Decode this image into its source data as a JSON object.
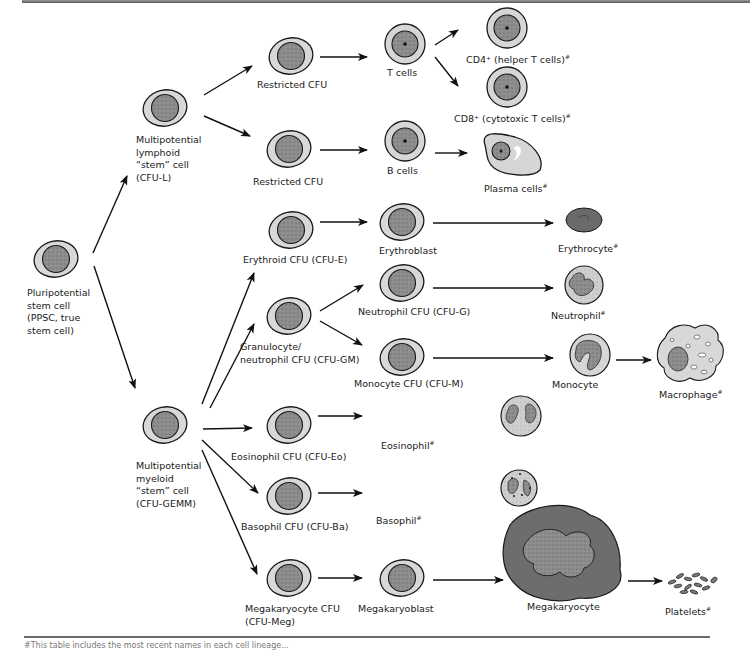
{
  "diagram": {
    "type": "hematopoiesis-lineage-tree",
    "nodes": {
      "ppsc": {
        "label_lines": [
          "Pluripotential",
          "stem cell",
          "(PPSC, true",
          "stem cell)"
        ]
      },
      "cfu_l": {
        "label_lines": [
          "Multipotential",
          "lymphoid",
          "“stem” cell",
          "(CFU-L)"
        ]
      },
      "cfu_gemm": {
        "label_lines": [
          "Multipotential",
          "myeloid",
          "“stem” cell",
          "(CFU-GEMM)"
        ]
      },
      "restricted_cfu_t": {
        "label": "Restricted CFU"
      },
      "restricted_cfu_b": {
        "label": "Restricted CFU"
      },
      "t_cells": {
        "label": "T cells"
      },
      "b_cells": {
        "label": "B cells"
      },
      "cd4": {
        "label": "CD4⁺ (helper T cells)",
        "mark": "#"
      },
      "cd8": {
        "label": "CD8⁺ (cytotoxic T cells)",
        "mark": "#"
      },
      "plasma": {
        "label": "Plasma cells",
        "mark": "#"
      },
      "cfu_e": {
        "label": "Erythroid CFU (CFU-E)"
      },
      "erythroblast": {
        "label": "Erythroblast"
      },
      "erythrocyte": {
        "label": "Erythrocyte",
        "mark": "#"
      },
      "cfu_gm": {
        "label_lines": [
          "Granulocyte/",
          "neutrophil CFU (CFU-GM)"
        ]
      },
      "cfu_g": {
        "label": "Neutrophil CFU (CFU-G)"
      },
      "neutrophil": {
        "label": "Neutrophil",
        "mark": "#"
      },
      "cfu_m": {
        "label": "Monocyte CFU (CFU-M)"
      },
      "monocyte": {
        "label": "Monocyte"
      },
      "macrophage": {
        "label": "Macrophage",
        "mark": "#"
      },
      "cfu_eo": {
        "label": "Eosinophil CFU (CFU-Eo)"
      },
      "eosinophil": {
        "label": "Eosinophil",
        "mark": "#"
      },
      "cfu_ba": {
        "label": "Basophil CFU (CFU-Ba)"
      },
      "basophil": {
        "label": "Basophil",
        "mark": "#"
      },
      "cfu_meg": {
        "label_lines": [
          "Megakaryocyte CFU",
          "(CFU-Meg)"
        ]
      },
      "megakaryoblast": {
        "label": "Megakaryoblast"
      },
      "megakaryocyte": {
        "label": "Megakaryocyte"
      },
      "platelets": {
        "label": "Platelets",
        "mark": "#"
      }
    },
    "edges": [
      [
        "ppsc",
        "cfu_l"
      ],
      [
        "ppsc",
        "cfu_gemm"
      ],
      [
        "cfu_l",
        "restricted_cfu_t"
      ],
      [
        "cfu_l",
        "restricted_cfu_b"
      ],
      [
        "restricted_cfu_t",
        "t_cells"
      ],
      [
        "t_cells",
        "cd4"
      ],
      [
        "t_cells",
        "cd8"
      ],
      [
        "restricted_cfu_b",
        "b_cells"
      ],
      [
        "b_cells",
        "plasma"
      ],
      [
        "cfu_gemm",
        "cfu_e"
      ],
      [
        "cfu_e",
        "erythroblast"
      ],
      [
        "erythroblast",
        "erythrocyte"
      ],
      [
        "cfu_gemm",
        "cfu_gm"
      ],
      [
        "cfu_gm",
        "cfu_g"
      ],
      [
        "cfu_g",
        "neutrophil"
      ],
      [
        "cfu_gm",
        "cfu_m"
      ],
      [
        "cfu_m",
        "monocyte"
      ],
      [
        "monocyte",
        "macrophage"
      ],
      [
        "cfu_gemm",
        "cfu_eo"
      ],
      [
        "cfu_eo",
        "eosinophil"
      ],
      [
        "cfu_gemm",
        "cfu_ba"
      ],
      [
        "cfu_ba",
        "basophil"
      ],
      [
        "cfu_gemm",
        "cfu_meg"
      ],
      [
        "cfu_meg",
        "megakaryoblast"
      ],
      [
        "megakaryoblast",
        "megakaryocyte"
      ],
      [
        "megakaryocyte",
        "platelets"
      ]
    ],
    "colors": {
      "cytoplasm": "#d6d6d6",
      "nucleus": "#8a8a8a",
      "outline": "#1a1a1a",
      "megakaryocyte_body": "#6e6e6e"
    }
  },
  "footnote": "#This table includes the most recent names in each cell lineage..."
}
